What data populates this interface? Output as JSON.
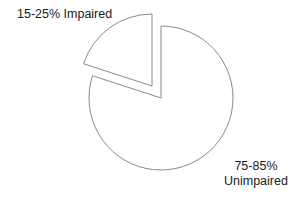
{
  "chart_data": {
    "type": "pie",
    "title": "",
    "slices": [
      {
        "label": "15-25% Impaired",
        "value": 20,
        "range": "15-25%",
        "category": "Impaired",
        "exploded": true,
        "fill": "#ffffff",
        "stroke": "#8a8a8a"
      },
      {
        "label": "75-85% Unimpaired",
        "value": 80,
        "range": "75-85%",
        "category": "Unimpaired",
        "exploded": false,
        "fill": "#ffffff",
        "stroke": "#8a8a8a"
      }
    ],
    "legend": null,
    "annotations": [
      "15-25% Impaired",
      "75-85% Unimpaired"
    ]
  },
  "labels": {
    "impaired": "15-25% Impaired",
    "unimpaired_line1": "75-85%",
    "unimpaired_line2": "Unimpaired"
  },
  "colors": {
    "slice_fill": "#ffffff",
    "slice_stroke": "#8a8a8a",
    "text": "#1a1a1a",
    "background": "#ffffff"
  }
}
